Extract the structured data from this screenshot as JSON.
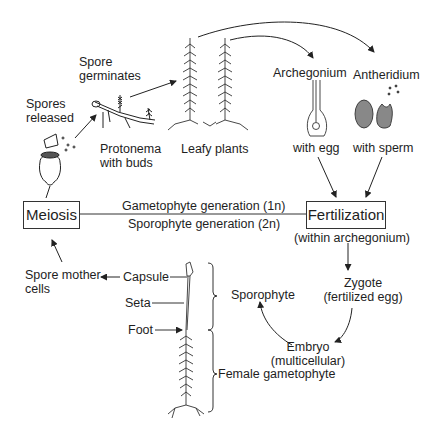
{
  "diagram": {
    "labels": {
      "spore_germinates": [
        "Spore",
        "germinates"
      ],
      "spores_released": [
        "Spores",
        "released"
      ],
      "protonema": [
        "Protonema",
        "with buds"
      ],
      "leafy_plants": "Leafy plants",
      "archegonium": "Archegonium",
      "antheridium": "Antheridium",
      "with_egg": "with egg",
      "with_sperm": "with sperm",
      "meiosis": "Meiosis",
      "fertilization": "Fertilization",
      "within_archegonium": "(within archegonium)",
      "gametophyte_generation": "Gametophyte generation (1n)",
      "sporophyte_generation": "Sporophyte generation (2n)",
      "spore_mother_cells": [
        "Spore mother",
        "cells"
      ],
      "capsule": "Capsule",
      "seta": "Seta",
      "foot": "Foot",
      "sporophyte": "Sporophyte",
      "zygote": [
        "Zygote",
        "(fertilized egg)"
      ],
      "embryo": [
        "Embryo",
        "(multicellular)"
      ],
      "female_gametophyte": "Female gametophyte"
    },
    "colors": {
      "ink": "#1e1e1e",
      "background": "#ffffff"
    }
  }
}
